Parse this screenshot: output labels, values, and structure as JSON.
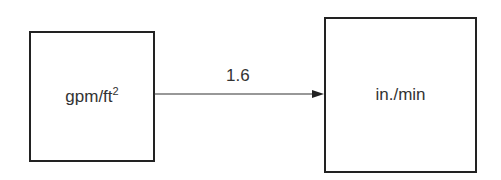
{
  "diagram": {
    "source": {
      "label": "gpm/ft",
      "superscript": "2"
    },
    "target": {
      "label": "in./min"
    },
    "arrow": {
      "label": "1.6",
      "direction": "left-to-right"
    }
  }
}
